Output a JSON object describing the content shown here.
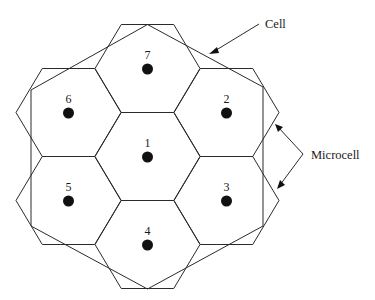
{
  "diagram": {
    "type": "cellular-cluster",
    "microcells": [
      {
        "id": "1",
        "label": "1",
        "cx": 147.5,
        "cy": 156.5
      },
      {
        "id": "2",
        "label": "2",
        "cx": 226.5,
        "cy": 112.5
      },
      {
        "id": "3",
        "label": "3",
        "cx": 226.5,
        "cy": 200.5
      },
      {
        "id": "4",
        "label": "4",
        "cx": 147.5,
        "cy": 244.5
      },
      {
        "id": "5",
        "label": "5",
        "cx": 68.5,
        "cy": 200.5
      },
      {
        "id": "6",
        "label": "6",
        "cx": 68.5,
        "cy": 112.5
      },
      {
        "id": "7",
        "label": "7",
        "cx": 147.5,
        "cy": 68.5
      }
    ],
    "callouts": {
      "cell": {
        "label": "Cell"
      },
      "microcell": {
        "label": "Microcell"
      }
    },
    "colors": {
      "line": "#2a2a2a",
      "dot": "#111111",
      "background": "#ffffff"
    }
  }
}
